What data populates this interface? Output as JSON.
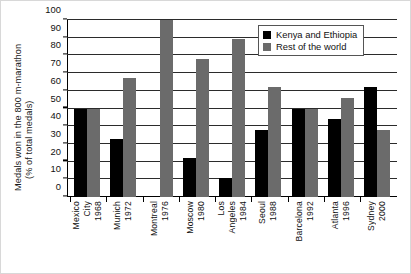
{
  "chart_data": {
    "type": "bar",
    "title": "",
    "xlabel": "",
    "ylabel_line1": "Medals won in the 800 m-marathon",
    "ylabel_line2": "(% of total medals)",
    "ylim": [
      0,
      100
    ],
    "yticks": [
      0,
      10,
      20,
      30,
      40,
      50,
      60,
      70,
      80,
      90,
      100
    ],
    "grid": true,
    "legend_position": "top-right",
    "categories": [
      "Mexico City 1968",
      "Munich 1972",
      "Montreal 1976",
      "Moscow 1980",
      "Los Angeles 1984",
      "Seoul 1988",
      "Barcelona 1992",
      "Atlanta 1996",
      "Sydney 2000"
    ],
    "category_lines": [
      [
        "Mexico",
        "City",
        "1968"
      ],
      [
        "Munich",
        "1972"
      ],
      [
        "Montreal",
        "1976"
      ],
      [
        "Moscow",
        "1980"
      ],
      [
        "Los",
        "Angeles",
        "1984"
      ],
      [
        "Seoul",
        "1988"
      ],
      [
        "Barcelona",
        "1992"
      ],
      [
        "Atlanta",
        "1996"
      ],
      [
        "Sydney",
        "2000"
      ]
    ],
    "series": [
      {
        "name": "Kenya and Ethiopia",
        "color": "#000000",
        "values": [
          50,
          33,
          0,
          22,
          11,
          38,
          50,
          44,
          62
        ]
      },
      {
        "name": "Rest of the world",
        "color": "#6b6b6b",
        "values": [
          50,
          67,
          100,
          78,
          89,
          62,
          50,
          56,
          38
        ]
      }
    ]
  },
  "legend": {
    "items": [
      {
        "label": "Kenya and Ethiopia",
        "color": "#000000"
      },
      {
        "label": "Rest of the world",
        "color": "#6b6b6b"
      }
    ]
  }
}
